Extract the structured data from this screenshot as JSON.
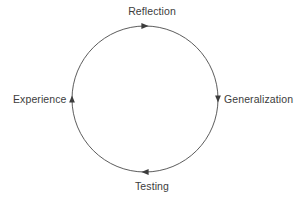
{
  "diagram": {
    "background_color": "#ffffff",
    "stroke_color": "#4a4a4a",
    "text_color": "#3c3c3c",
    "geometry": {
      "center_x": 145,
      "center_y": 99,
      "radius": 73,
      "stroke_width": 0.9
    },
    "direction": "clockwise",
    "nodes": [
      {
        "id": "reflection",
        "label": "Reflection",
        "position": "top",
        "marker": "arrow-right-icon",
        "marker_x": 145,
        "marker_y": 26
      },
      {
        "id": "generalization",
        "label": "Generalization",
        "position": "right",
        "marker": "arrow-down-icon",
        "marker_x": 218,
        "marker_y": 99
      },
      {
        "id": "testing",
        "label": "Testing",
        "position": "bottom",
        "marker": "arrow-left-icon",
        "marker_x": 145,
        "marker_y": 172
      },
      {
        "id": "experience",
        "label": "Experience",
        "position": "left",
        "marker": "arrow-up-icon",
        "marker_x": 72,
        "marker_y": 99
      }
    ]
  }
}
